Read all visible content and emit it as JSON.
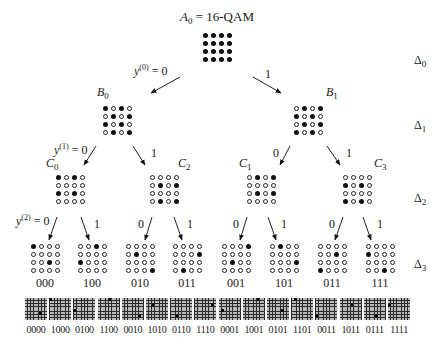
{
  "root": {
    "name": "A",
    "index": "0",
    "suffix": " = 16-QAM",
    "pattern": [
      [
        1,
        1,
        1,
        1
      ],
      [
        1,
        1,
        1,
        1
      ],
      [
        1,
        1,
        1,
        1
      ],
      [
        1,
        1,
        1,
        1
      ]
    ]
  },
  "level1": [
    {
      "name": "B",
      "index": "0",
      "pattern": [
        [
          1,
          0,
          1,
          0
        ],
        [
          0,
          1,
          0,
          1
        ],
        [
          1,
          0,
          1,
          0
        ],
        [
          0,
          1,
          0,
          1
        ]
      ]
    },
    {
      "name": "B",
      "index": "1",
      "pattern": [
        [
          0,
          1,
          0,
          1
        ],
        [
          1,
          0,
          1,
          0
        ],
        [
          0,
          1,
          0,
          1
        ],
        [
          1,
          0,
          1,
          0
        ]
      ]
    }
  ],
  "level2": [
    {
      "name": "C",
      "index": "0",
      "pattern": [
        [
          1,
          0,
          1,
          0
        ],
        [
          0,
          0,
          0,
          0
        ],
        [
          1,
          0,
          1,
          0
        ],
        [
          0,
          0,
          0,
          0
        ]
      ]
    },
    {
      "name": "C",
      "index": "2",
      "pattern": [
        [
          0,
          0,
          0,
          0
        ],
        [
          0,
          1,
          0,
          1
        ],
        [
          0,
          0,
          0,
          0
        ],
        [
          0,
          1,
          0,
          1
        ]
      ]
    },
    {
      "name": "C",
      "index": "1",
      "pattern": [
        [
          0,
          1,
          0,
          1
        ],
        [
          0,
          0,
          0,
          0
        ],
        [
          0,
          1,
          0,
          1
        ],
        [
          0,
          0,
          0,
          0
        ]
      ]
    },
    {
      "name": "C",
      "index": "3",
      "pattern": [
        [
          0,
          0,
          0,
          0
        ],
        [
          1,
          0,
          1,
          0
        ],
        [
          0,
          0,
          0,
          0
        ],
        [
          1,
          0,
          1,
          0
        ]
      ]
    }
  ],
  "level3": [
    {
      "code": "000",
      "pattern": [
        [
          1,
          0,
          0,
          0
        ],
        [
          0,
          0,
          0,
          0
        ],
        [
          0,
          0,
          1,
          0
        ],
        [
          0,
          0,
          0,
          0
        ]
      ]
    },
    {
      "code": "100",
      "pattern": [
        [
          0,
          0,
          1,
          0
        ],
        [
          0,
          0,
          0,
          0
        ],
        [
          1,
          0,
          0,
          0
        ],
        [
          0,
          0,
          0,
          0
        ]
      ]
    },
    {
      "code": "010",
      "pattern": [
        [
          0,
          0,
          0,
          0
        ],
        [
          0,
          1,
          0,
          0
        ],
        [
          0,
          0,
          0,
          0
        ],
        [
          0,
          0,
          0,
          1
        ]
      ]
    },
    {
      "code": "011",
      "pattern": [
        [
          0,
          0,
          0,
          0
        ],
        [
          0,
          0,
          0,
          1
        ],
        [
          0,
          0,
          0,
          0
        ],
        [
          0,
          1,
          0,
          0
        ]
      ]
    },
    {
      "code": "001",
      "pattern": [
        [
          0,
          0,
          0,
          1
        ],
        [
          0,
          0,
          0,
          0
        ],
        [
          0,
          1,
          0,
          0
        ],
        [
          0,
          0,
          0,
          0
        ]
      ]
    },
    {
      "code": "101",
      "pattern": [
        [
          0,
          1,
          0,
          0
        ],
        [
          0,
          0,
          0,
          0
        ],
        [
          0,
          0,
          0,
          1
        ],
        [
          0,
          0,
          0,
          0
        ]
      ]
    },
    {
      "code": "011",
      "pattern": [
        [
          0,
          0,
          0,
          0
        ],
        [
          0,
          0,
          1,
          0
        ],
        [
          0,
          0,
          0,
          0
        ],
        [
          1,
          0,
          0,
          0
        ]
      ]
    },
    {
      "code": "111",
      "pattern": [
        [
          0,
          0,
          0,
          0
        ],
        [
          1,
          0,
          0,
          0
        ],
        [
          0,
          0,
          0,
          0
        ],
        [
          0,
          0,
          1,
          0
        ]
      ]
    }
  ],
  "branch_labels": {
    "l0_left": {
      "var": "y",
      "sup": "(0)",
      "eq": " = 0"
    },
    "l0_right": "1",
    "l1_left": {
      "var": "y",
      "sup": "(1)",
      "eq": " = 0"
    },
    "l1_right": "1",
    "l1b_left": "0",
    "l1b_right": "1",
    "l2_left": {
      "var": "y",
      "sup": "(2)",
      "eq": " = 0"
    },
    "l2_right": "1",
    "l2b_left": "0",
    "l2b_right": "1",
    "l2c_left": "0",
    "l2c_right": "1",
    "l2d_left": "0",
    "l2d_right": "1"
  },
  "distances": [
    {
      "sym": "Δ",
      "index": "0"
    },
    {
      "sym": "Δ",
      "index": "1"
    },
    {
      "sym": "Δ",
      "index": "2"
    },
    {
      "sym": "Δ",
      "index": "3"
    }
  ],
  "leaves": [
    {
      "code": "0000",
      "row": 5,
      "col": 5
    },
    {
      "code": "1000",
      "row": 0,
      "col": 0
    },
    {
      "code": "0100",
      "row": 4,
      "col": 0
    },
    {
      "code": "1100",
      "row": 0,
      "col": 4
    },
    {
      "code": "0010",
      "row": 6,
      "col": 6
    },
    {
      "code": "1010",
      "row": 2,
      "col": 2
    },
    {
      "code": "0110",
      "row": 6,
      "col": 2
    },
    {
      "code": "1110",
      "row": 2,
      "col": 6
    },
    {
      "code": "0001",
      "row": 4,
      "col": 1
    },
    {
      "code": "1001",
      "row": 0,
      "col": 5
    },
    {
      "code": "0101",
      "row": 4,
      "col": 5
    },
    {
      "code": "1101",
      "row": 0,
      "col": 1
    },
    {
      "code": "0011",
      "row": 6,
      "col": 0
    },
    {
      "code": "1011",
      "row": 2,
      "col": 4
    },
    {
      "code": "0111",
      "row": 6,
      "col": 4
    },
    {
      "code": "1111",
      "row": 2,
      "col": 0
    }
  ]
}
